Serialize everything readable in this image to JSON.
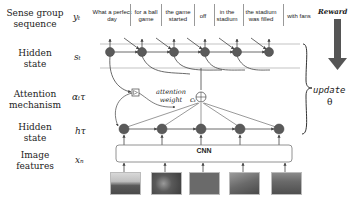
{
  "row_labels": [
    {
      "label": "Sense group\nsequence",
      "symbol": "y_t",
      "symbol_text": "yₜ"
    },
    {
      "label": "Hidden\nstate",
      "symbol": "s_t",
      "symbol_text": "sₜ"
    },
    {
      "label": "Attention\nmechanism",
      "symbol": "α_tτ",
      "symbol_text": "αₜτ"
    },
    {
      "label": "Hidden\nstate",
      "symbol": "h_τ",
      "symbol_text": "hτ"
    },
    {
      "label": "Image\nfeatures",
      "symbol": "x_n",
      "symbol_text": "xₙ"
    }
  ],
  "sense_groups": [
    "What a perfect day",
    "for a ball game",
    "the game started",
    "off",
    "in the stadium",
    "the stadium was filled",
    "with fans"
  ],
  "attention": {
    "label": "attention weight",
    "context_symbol": "cₜ"
  },
  "encoder": {
    "label": "CNN"
  },
  "reward": {
    "label": "Reward"
  },
  "update": {
    "label": "update",
    "param": "θ"
  },
  "colors": {
    "node": "#5a5a5a",
    "arrow": "#444444",
    "reward_arrow": "#555555"
  }
}
